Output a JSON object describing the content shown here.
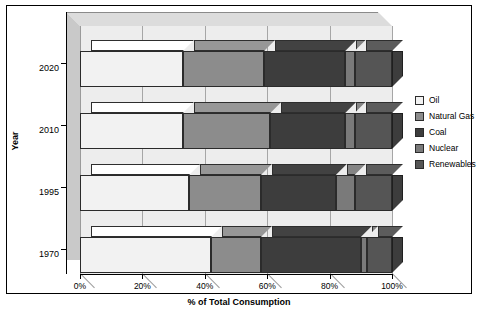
{
  "chart_data": {
    "type": "bar",
    "orientation": "horizontal",
    "stacked": true,
    "style": "3d",
    "title": "",
    "xlabel": "% of Total Consumption",
    "ylabel": "Year",
    "xlim": [
      0,
      100
    ],
    "xticks": [
      "0%",
      "20%",
      "40%",
      "60%",
      "80%",
      "100%"
    ],
    "xtick_values": [
      0,
      20,
      40,
      60,
      80,
      100
    ],
    "categories": [
      "2020",
      "2010",
      "1995",
      "1970"
    ],
    "grid": "vertical",
    "legend_position": "right",
    "series": [
      {
        "name": "Oil",
        "color": "#f2f2f2",
        "values": [
          33,
          33,
          35,
          42
        ]
      },
      {
        "name": "Natural Gas",
        "color": "#8c8c8c",
        "values": [
          26,
          28,
          23,
          16
        ]
      },
      {
        "name": "Coal",
        "color": "#3d3d3d",
        "values": [
          26,
          24,
          24,
          32
        ]
      },
      {
        "name": "Nuclear",
        "color": "#7a7a7a",
        "values": [
          3,
          3,
          6,
          2
        ]
      },
      {
        "name": "Renewables",
        "color": "#555555",
        "values": [
          12,
          12,
          12,
          8
        ]
      }
    ]
  },
  "axes": {
    "x_title": "% of Total Consumption",
    "y_title": "Year",
    "x_ticks": [
      "0%",
      "20%",
      "40%",
      "60%",
      "80%",
      "100%"
    ],
    "y_ticks": [
      "2020",
      "2010",
      "1995",
      "1970"
    ]
  },
  "legend": {
    "items": [
      {
        "label": "Oil",
        "color": "#f2f2f2"
      },
      {
        "label": "Natural Gas",
        "color": "#8c8c8c"
      },
      {
        "label": "Coal",
        "color": "#3d3d3d"
      },
      {
        "label": "Nuclear",
        "color": "#7a7a7a"
      },
      {
        "label": "Renewables",
        "color": "#555555"
      }
    ]
  },
  "colors": {
    "plot_face": "#ededed",
    "plot_wall": "#c9c9c9",
    "plot_top": "#dcdcdc",
    "gridline": "#a6a6a6",
    "outline": "#2b2b2b",
    "axis": "#000000"
  }
}
